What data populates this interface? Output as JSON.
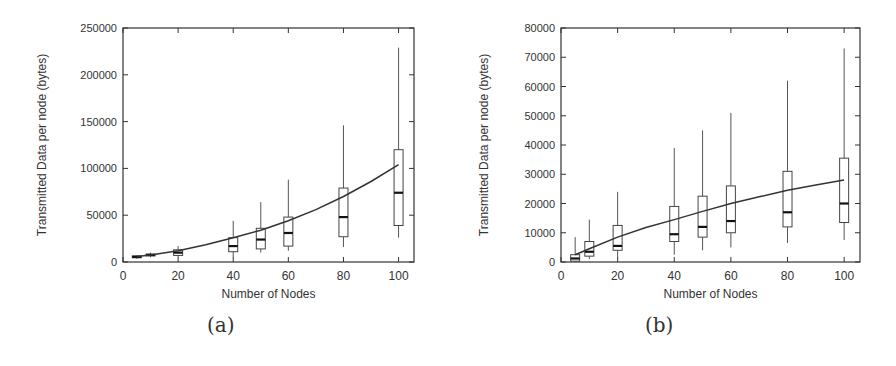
{
  "chart_data": [
    {
      "id": "a",
      "type": "box",
      "caption": "(a)",
      "xlabel": "Number of Nodes",
      "ylabel": "Transmitted Data per node (bytes)",
      "xlim": [
        0,
        105.6
      ],
      "ylim": [
        0,
        250000
      ],
      "xticks": [
        0,
        20,
        40,
        60,
        80,
        100
      ],
      "yticks": [
        0,
        50000,
        100000,
        150000,
        200000,
        250000
      ],
      "grid": false,
      "boxes": [
        {
          "x": 5,
          "whisker_low": 3500,
          "q1": 4500,
          "median": 5500,
          "q3": 6500,
          "whisker_high": 7000
        },
        {
          "x": 10,
          "whisker_low": 5000,
          "q1": 6500,
          "median": 7500,
          "q3": 8500,
          "whisker_high": 10000
        },
        {
          "x": 20,
          "whisker_low": 5000,
          "q1": 7000,
          "median": 10000,
          "q3": 13000,
          "whisker_high": 17000
        },
        {
          "x": 40,
          "whisker_low": 5000,
          "q1": 11000,
          "median": 17000,
          "q3": 26000,
          "whisker_high": 44000
        },
        {
          "x": 50,
          "whisker_low": 10000,
          "q1": 14000,
          "median": 24000,
          "q3": 36000,
          "whisker_high": 64000
        },
        {
          "x": 60,
          "whisker_low": 12000,
          "q1": 17000,
          "median": 31000,
          "q3": 48000,
          "whisker_high": 88000
        },
        {
          "x": 80,
          "whisker_low": 16000,
          "q1": 27000,
          "median": 48000,
          "q3": 79000,
          "whisker_high": 146000
        },
        {
          "x": 100,
          "whisker_low": 26000,
          "q1": 39000,
          "median": 74000,
          "q3": 120000,
          "whisker_high": 229000
        }
      ],
      "fit_curve": {
        "x": [
          5,
          10,
          20,
          30,
          40,
          50,
          60,
          70,
          80,
          90,
          100
        ],
        "y": [
          6000,
          7500,
          12000,
          18500,
          26000,
          34000,
          44000,
          56000,
          70000,
          86000,
          104000
        ]
      },
      "plot_px": {
        "left": 123,
        "top": 28,
        "right": 414,
        "bottom": 262
      }
    },
    {
      "id": "b",
      "type": "box",
      "caption": "(b)",
      "xlabel": "Number of Nodes",
      "ylabel": "Transmitted Data per node (bytes)",
      "xlim": [
        0,
        105.6
      ],
      "ylim": [
        0,
        80000
      ],
      "xticks": [
        0,
        20,
        40,
        60,
        80,
        100
      ],
      "yticks": [
        0,
        10000,
        20000,
        30000,
        40000,
        50000,
        60000,
        70000,
        80000
      ],
      "grid": false,
      "boxes": [
        {
          "x": 5,
          "whisker_low": 0,
          "q1": 300,
          "median": 1200,
          "q3": 2500,
          "whisker_high": 8500
        },
        {
          "x": 10,
          "whisker_low": 1000,
          "q1": 2000,
          "median": 3500,
          "q3": 7000,
          "whisker_high": 14500
        },
        {
          "x": 20,
          "whisker_low": 1000,
          "q1": 4000,
          "median": 5500,
          "q3": 12500,
          "whisker_high": 24000
        },
        {
          "x": 40,
          "whisker_low": 2500,
          "q1": 7000,
          "median": 9500,
          "q3": 19000,
          "whisker_high": 39000
        },
        {
          "x": 50,
          "whisker_low": 4000,
          "q1": 8500,
          "median": 12000,
          "q3": 22500,
          "whisker_high": 45000
        },
        {
          "x": 60,
          "whisker_low": 5000,
          "q1": 10000,
          "median": 14000,
          "q3": 26000,
          "whisker_high": 51000
        },
        {
          "x": 80,
          "whisker_low": 6500,
          "q1": 12000,
          "median": 17000,
          "q3": 31000,
          "whisker_high": 62000
        },
        {
          "x": 100,
          "whisker_low": 7500,
          "q1": 13500,
          "median": 20000,
          "q3": 35500,
          "whisker_high": 73000
        }
      ],
      "fit_curve": {
        "x": [
          5,
          10,
          20,
          30,
          40,
          50,
          60,
          70,
          80,
          90,
          100
        ],
        "y": [
          2500,
          4500,
          8500,
          11800,
          14500,
          17300,
          20000,
          22300,
          24500,
          26300,
          28000
        ]
      },
      "plot_px": {
        "left": 561,
        "top": 28,
        "right": 860,
        "bottom": 262
      }
    }
  ],
  "captions": {
    "a": "(a)",
    "b": "(b)"
  }
}
